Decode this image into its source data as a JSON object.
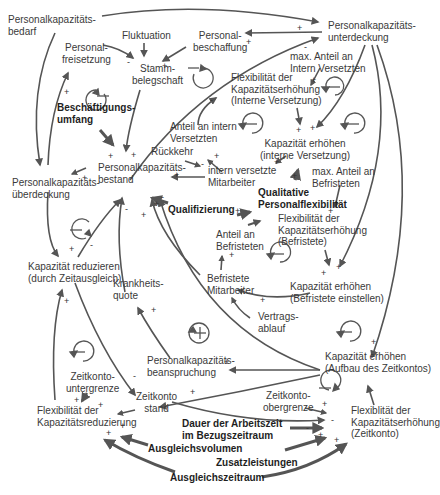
{
  "diagram": {
    "type": "causal-loop-diagram",
    "nodes": {
      "pk_bedarf": "Personalkapazitäts-\nbedarf",
      "fluktuation": "Fluktuation",
      "freisetzung": "Personal-\nfreisetzung",
      "beschaffung": "Personal-\nbeschaffung",
      "stamm": "Stamm-\nbelegschaft",
      "unterdeckung": "Personalkapazitäts-\nunterdeckung",
      "max_intern": "max. Anteil an\nIntern Versetzten",
      "flex_intern": "Flexibilität der\nKapazitätserhöhung\n(Interne Versetzung)",
      "beschaeftigungsumfang": "Beschäftigungs-\numfang",
      "anteil_intern": "Anteil an intern\nVersetzten",
      "rueckkehr": "Rückkehr",
      "kap_erh_intern": "Kapazität erhöhen\n(interne Versetzung)",
      "ueberdeckung": "Personalkapazitäts-\nüberdeckung",
      "bestand": "Personalkapazitäts-\nbestand",
      "intern_mitarbeiter": "intern versetzte\nMitarbeiter",
      "max_befristet": "max. Anteil an\nBefristeten",
      "qualitative": "Qualitative\nPersonalflexibilität",
      "qualifizierung": "Qualifizierung",
      "flex_befristet": "Flexibilität der\nKapazitätserhöhung\n(Befristete)",
      "anteil_befristet": "Anteil an\nBefristeten",
      "kap_reduzieren": "Kapazität reduzieren\n(durch Zeitausgleich)",
      "krankheit": "Krankheits-\nquote",
      "befristete_ma": "Befristete\nMitarbeiter",
      "kap_erh_befristet": "Kapazität erhöhen\n(Befristete einstellen)",
      "vertragsablauf": "Vertrags-\nablauf",
      "beanspruchung": "Personalkapazitäts-\nbeanspruchung",
      "kap_erh_zeitkonto": "Kapazität erhöhen\n(Aufbau des Zeitkontos)",
      "zk_untergrenze": "Zeitkonto-\nuntergrenze",
      "zk_obergrenze": "Zeitkonto-\nobergrenze",
      "zk_stand": "Zeitkonto\nstand",
      "flex_reduzierung": "Flexibilität der\nKapazitätsreduzierung",
      "flex_zeitkonto": "Flexiblität der\nKapazitätserhöhung\n(Zeitkonto)",
      "dauer": "Dauer der Arbeitszeit\nim Bezugszeitraum",
      "ausgleichsvolumen": "Ausgleichsvolumen",
      "zusatzleistungen": "Zusatzleistungen",
      "ausgleichszeitraum": "Ausgleichszeitraum"
    },
    "signs": {
      "plus": "+",
      "minus": "-"
    },
    "loops": [
      {
        "id": "loop-freisetzung",
        "polarity": "balancing",
        "symbol": "−"
      },
      {
        "id": "loop-beschaffung",
        "polarity": "balancing",
        "symbol": "−"
      },
      {
        "id": "loop-intern-max",
        "polarity": "balancing",
        "symbol": "−"
      },
      {
        "id": "loop-intern-anteil",
        "polarity": "balancing",
        "symbol": "−"
      },
      {
        "id": "loop-kap-intern",
        "polarity": "balancing",
        "symbol": "−"
      },
      {
        "id": "loop-ueberdeckung",
        "polarity": "balancing",
        "symbol": "−"
      },
      {
        "id": "loop-befristet",
        "polarity": "balancing",
        "symbol": "−"
      },
      {
        "id": "loop-beanspruchung",
        "polarity": "reinforcing",
        "symbol": "+"
      },
      {
        "id": "loop-zeitkonto-erh",
        "polarity": "balancing",
        "symbol": "−"
      },
      {
        "id": "loop-reduzierung",
        "polarity": "balancing",
        "symbol": "−"
      },
      {
        "id": "loop-zeitkonto",
        "polarity": "balancing",
        "symbol": "−"
      }
    ],
    "colors": {
      "arrow": "#555555",
      "text": "#3a3a3a",
      "background": "#ffffff"
    }
  }
}
